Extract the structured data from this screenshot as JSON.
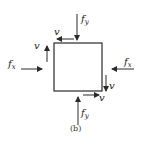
{
  "diagram": {
    "type": "stress-element",
    "caption": "(b)",
    "colors": {
      "stroke": "#2a2a2a",
      "background": "#ffffff"
    },
    "element": {
      "shape": "square",
      "x": 54,
      "y": 43,
      "size": 48
    },
    "labels": {
      "fx_left": {
        "main": "f",
        "sub": "x"
      },
      "fx_right": {
        "main": "f",
        "sub": "x"
      },
      "fy_top": {
        "main": "f",
        "sub": "y"
      },
      "fy_bottom": {
        "main": "f",
        "sub": "y"
      },
      "v_top": "v",
      "v_left": "v",
      "v_right": "v",
      "v_bottom": "v"
    },
    "arrows": [
      {
        "name": "fy-top",
        "direction": "down"
      },
      {
        "name": "v-top",
        "direction": "left"
      },
      {
        "name": "v-left",
        "direction": "up"
      },
      {
        "name": "fx-left",
        "direction": "right"
      },
      {
        "name": "fx-right",
        "direction": "left"
      },
      {
        "name": "v-right",
        "direction": "down"
      },
      {
        "name": "v-bottom",
        "direction": "right"
      },
      {
        "name": "fy-bottom",
        "direction": "up"
      }
    ]
  }
}
